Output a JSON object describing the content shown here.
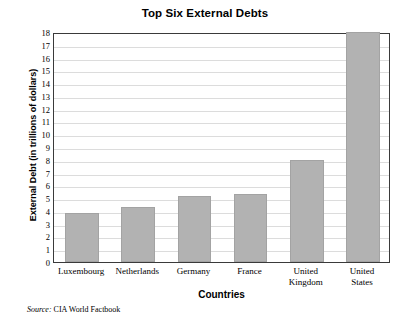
{
  "chart_data": {
    "type": "bar",
    "title": "Top Six External Debts",
    "xlabel": "Countries",
    "ylabel": "External Debt (in trillions of dollars)",
    "categories": [
      "Luxembourg",
      "Netherlands",
      "Germany",
      "France",
      "United Kingdom",
      "United States"
    ],
    "category_lines": [
      [
        "Luxembourg"
      ],
      [
        "Netherlands"
      ],
      [
        "Germany"
      ],
      [
        "France"
      ],
      [
        "United",
        "Kingdom"
      ],
      [
        "United",
        "States"
      ]
    ],
    "values": [
      3.8,
      4.3,
      5.2,
      5.3,
      8.0,
      18.0
    ],
    "ylim": [
      0,
      18
    ],
    "ytick_labels": [
      "18",
      "17",
      "16",
      "15",
      "14",
      "13",
      "12",
      "11",
      "10",
      "9",
      "8",
      "7",
      "6",
      "5",
      "4",
      "3",
      "2",
      "1",
      "0"
    ],
    "ytick_values": [
      18,
      17,
      16,
      15,
      14,
      13,
      12,
      11,
      10,
      9,
      8,
      7,
      6,
      5,
      4,
      3,
      2,
      1,
      0
    ],
    "grid": true,
    "legend": "none",
    "bar_color": "#b2b2b2",
    "grid_color": "#dcdcdc",
    "axis_color": "#3a3a3a"
  },
  "source": {
    "label": "Source:",
    "text": "CIA World Factbook"
  }
}
